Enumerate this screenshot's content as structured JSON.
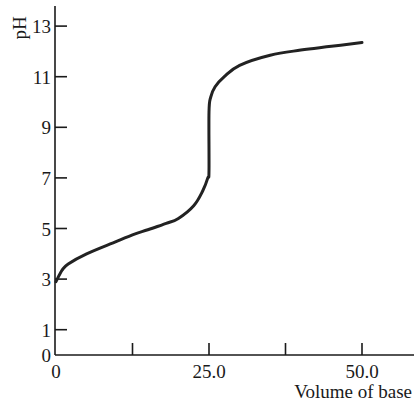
{
  "chart_data": {
    "type": "line",
    "title": "",
    "xlabel": "Volume of base",
    "ylabel": "pH",
    "xlim": [
      0,
      56
    ],
    "ylim": [
      0,
      14
    ],
    "grid": false,
    "x_ticks": [
      0,
      12.5,
      25,
      37.5,
      50
    ],
    "x_tick_labels": [
      "0",
      "",
      "25.0",
      "",
      "50.0"
    ],
    "y_ticks": [
      0,
      1,
      3,
      5,
      7,
      9,
      11,
      13
    ],
    "y_tick_labels": [
      "0",
      "1",
      "3",
      "5",
      "7",
      "9",
      "11",
      "13"
    ],
    "series": [
      {
        "name": "titration curve",
        "color": "#222222",
        "x": [
          0,
          1,
          2,
          5,
          10,
          12.5,
          15,
          18,
          20,
          22.5,
          24,
          24.8,
          25,
          25,
          25.3,
          26,
          27.5,
          30,
          35,
          40,
          45,
          50
        ],
        "y": [
          2.9,
          3.35,
          3.6,
          4.0,
          4.5,
          4.75,
          4.95,
          5.2,
          5.4,
          5.9,
          6.5,
          7.0,
          7.3,
          9.6,
          10.2,
          10.6,
          11.0,
          11.45,
          11.85,
          12.05,
          12.2,
          12.35
        ]
      }
    ]
  }
}
